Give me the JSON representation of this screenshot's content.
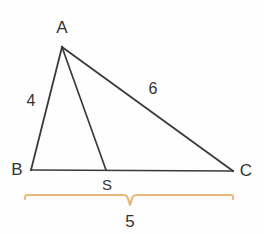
{
  "figure": {
    "background_color": "#fefefe",
    "stroke_color": "#3a3a3a",
    "brace_color": "#e8b878",
    "text_color": "#333333"
  },
  "points": {
    "A": {
      "label": "A",
      "x": 62,
      "y": 47,
      "label_x": 62,
      "label_y": 27
    },
    "B": {
      "label": "B",
      "x": 31,
      "y": 170,
      "label_x": 17,
      "label_y": 169
    },
    "C": {
      "label": "C",
      "x": 233,
      "y": 171,
      "label_x": 246,
      "label_y": 170
    },
    "S": {
      "label": "S",
      "x": 106,
      "y": 169,
      "label_x": 107,
      "label_y": 184
    }
  },
  "segments": [
    {
      "name": "AB",
      "from": "A",
      "to": "B",
      "length_label": "4",
      "label_x": 31,
      "label_y": 101
    },
    {
      "name": "AC",
      "from": "A",
      "to": "C",
      "length_label": "6",
      "label_x": 153,
      "label_y": 89
    },
    {
      "name": "BC",
      "from": "B",
      "to": "C",
      "length_label": "",
      "label_x": 0,
      "label_y": 0
    },
    {
      "name": "AS",
      "from": "A",
      "to": "S",
      "length_label": "",
      "label_x": 0,
      "label_y": 0
    }
  ],
  "brace": {
    "label": "5",
    "left_x": 25,
    "right_x": 233,
    "center_x": 130,
    "top_y": 196,
    "peak_y": 206,
    "label_x": 130,
    "label_y": 221,
    "color": "#e8b878"
  }
}
